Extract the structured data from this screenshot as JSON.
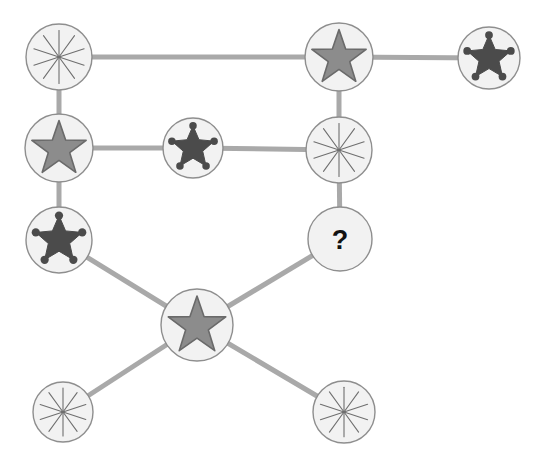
{
  "canvas": {
    "width": 540,
    "height": 475,
    "background_color": "#ffffff"
  },
  "style": {
    "node_fill": "#f2f2f2",
    "node_stroke": "#8e8e8e",
    "edge_color": "#a9a9a9",
    "edge_width": 5,
    "starburst_color": "#6f6f6f",
    "star_fill": "#8c8c8c",
    "star_stroke": "#6a6a6a",
    "badge_color": "#4b4b4b",
    "question_color": "#111111"
  },
  "legend": {
    "icon_types": [
      {
        "key": "starburst",
        "label": "starburst",
        "points": 10,
        "color": "#6f6f6f"
      },
      {
        "key": "star",
        "label": "five-point-star",
        "points": 5,
        "color": "#8c8c8c"
      },
      {
        "key": "badge",
        "label": "sheriff-badge-star",
        "points": 5,
        "color": "#4b4b4b"
      },
      {
        "key": "question",
        "label": "question-mark",
        "text": "?",
        "color": "#111111"
      }
    ]
  },
  "graph": {
    "node_count": 11,
    "edge_count": 11,
    "unknown_label": "?",
    "nodes": [
      {
        "id": "n1",
        "name": "node-starburst-top-left",
        "icon": "starburst",
        "cx": 59,
        "cy": 57,
        "r": 33,
        "label": ""
      },
      {
        "id": "n2",
        "name": "node-star-top-center",
        "icon": "star",
        "cx": 339,
        "cy": 57,
        "r": 34,
        "label": ""
      },
      {
        "id": "n3",
        "name": "node-badge-top-right",
        "icon": "badge",
        "cx": 489,
        "cy": 58,
        "r": 31,
        "label": ""
      },
      {
        "id": "n4",
        "name": "node-star-middle-left",
        "icon": "star",
        "cx": 59,
        "cy": 148,
        "r": 34,
        "label": ""
      },
      {
        "id": "n5",
        "name": "node-badge-middle-center",
        "icon": "badge",
        "cx": 193,
        "cy": 148,
        "r": 30,
        "label": ""
      },
      {
        "id": "n6",
        "name": "node-starburst-middle-right",
        "icon": "starburst",
        "cx": 339,
        "cy": 150,
        "r": 33,
        "label": ""
      },
      {
        "id": "n7",
        "name": "node-badge-lower-left",
        "icon": "badge",
        "cx": 59,
        "cy": 240,
        "r": 33,
        "label": ""
      },
      {
        "id": "n8",
        "name": "node-question-unknown",
        "icon": "question",
        "cx": 340,
        "cy": 239,
        "r": 32,
        "label": "?"
      },
      {
        "id": "n9",
        "name": "node-star-center-hub",
        "icon": "star",
        "cx": 197,
        "cy": 325,
        "r": 36,
        "label": ""
      },
      {
        "id": "n10",
        "name": "node-starburst-bottom-left",
        "icon": "starburst",
        "cx": 63,
        "cy": 412,
        "r": 30,
        "label": ""
      },
      {
        "id": "n11",
        "name": "node-starburst-bottom-right",
        "icon": "starburst",
        "cx": 344,
        "cy": 412,
        "r": 31,
        "label": ""
      }
    ],
    "edges": [
      {
        "from": "n1",
        "to": "n2",
        "name": "edge-starburst-top-left-to-star-top-center"
      },
      {
        "from": "n2",
        "to": "n3",
        "name": "edge-star-top-center-to-badge-top-right"
      },
      {
        "from": "n1",
        "to": "n4",
        "name": "edge-starburst-top-left-to-star-middle-left"
      },
      {
        "from": "n2",
        "to": "n6",
        "name": "edge-star-top-center-to-starburst-middle-right"
      },
      {
        "from": "n4",
        "to": "n5",
        "name": "edge-star-middle-left-to-badge-middle-center"
      },
      {
        "from": "n5",
        "to": "n6",
        "name": "edge-badge-middle-center-to-starburst-middle-right"
      },
      {
        "from": "n4",
        "to": "n7",
        "name": "edge-star-middle-left-to-badge-lower-left"
      },
      {
        "from": "n6",
        "to": "n8",
        "name": "edge-starburst-middle-right-to-question"
      },
      {
        "from": "n7",
        "to": "n9",
        "name": "edge-badge-lower-left-to-star-center-hub"
      },
      {
        "from": "n8",
        "to": "n9",
        "name": "edge-question-to-star-center-hub"
      },
      {
        "from": "n9",
        "to": "n10",
        "name": "edge-star-center-hub-to-starburst-bottom-left"
      },
      {
        "from": "n9",
        "to": "n11",
        "name": "edge-star-center-hub-to-starburst-bottom-right"
      }
    ]
  }
}
